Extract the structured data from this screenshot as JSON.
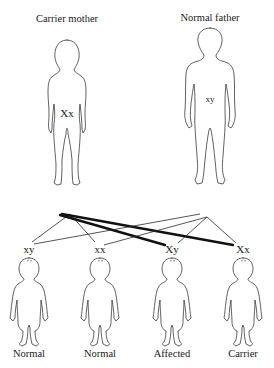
{
  "diagram": {
    "topic": "X-linked recessive inheritance",
    "parents": [
      {
        "id": "mother",
        "title": "Carrier mother",
        "genotype": "Xx"
      },
      {
        "id": "father",
        "title": "Normal father",
        "genotype": "xy"
      }
    ],
    "offspring": [
      {
        "genotype": "xy",
        "label": "Normal"
      },
      {
        "genotype": "xx",
        "label": "Normal"
      },
      {
        "genotype": "Xy",
        "label": "Affected"
      },
      {
        "genotype": "Xx",
        "label": "Carrier"
      }
    ],
    "inheritance_lines": {
      "thin": "normal x allele / y chromosome transmission",
      "thick": "affected X allele transmission from mother"
    },
    "colors": {
      "background": "#ffffff",
      "line": "#111111",
      "outline": "#3a3a3a",
      "text": "#1a1a1a"
    }
  }
}
